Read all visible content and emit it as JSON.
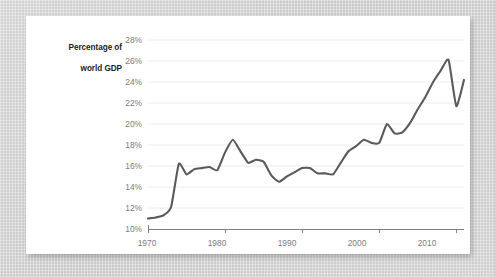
{
  "card": {
    "background_color": "#ffffff",
    "backdrop_color": "#d2d2d2"
  },
  "chart_data": {
    "type": "line",
    "title": "",
    "subtitle": "",
    "xlabel": "",
    "ylabel": "Percentage of\nworld GDP",
    "ylabel_line1": "Percentage of",
    "ylabel_line2": "world GDP",
    "xlim": [
      1970,
      2011
    ],
    "ylim": [
      10,
      28
    ],
    "ytick_step": 2,
    "grid": "horizontal",
    "legend": "none",
    "line_color": "#5a5a5a",
    "line_width": 2.1,
    "axis_color": "#808080",
    "gridline_color": "#ececec",
    "tick_label_color": "#7c7c7c",
    "ytick_labels": [
      "28%",
      "26%",
      "24%",
      "22%",
      "20%",
      "18%",
      "16%",
      "14%",
      "12%",
      "10%"
    ],
    "ytick_values": [
      28,
      26,
      24,
      22,
      20,
      18,
      16,
      14,
      12,
      10
    ],
    "xtick_labels": [
      "1970",
      "1980",
      "1990",
      "2000",
      "2010"
    ],
    "xtick_values": [
      1970,
      1980,
      1990,
      2000,
      2010
    ],
    "x": [
      1970,
      1971,
      1972,
      1973,
      1974,
      1975,
      1976,
      1977,
      1978,
      1979,
      1980,
      1981,
      1982,
      1983,
      1984,
      1985,
      1986,
      1987,
      1988,
      1989,
      1990,
      1991,
      1992,
      1993,
      1994,
      1995,
      1996,
      1997,
      1998,
      1999,
      2000,
      2001,
      2002,
      2003,
      2004,
      2005,
      2006,
      2007,
      2008,
      2009,
      2010,
      2011
    ],
    "values": [
      11.0,
      11.1,
      11.3,
      12.1,
      16.2,
      15.2,
      15.7,
      15.8,
      15.9,
      15.6,
      17.3,
      18.5,
      17.4,
      16.3,
      16.6,
      16.4,
      15.1,
      14.5,
      15.0,
      15.4,
      15.8,
      15.8,
      15.3,
      15.3,
      15.2,
      16.3,
      17.4,
      17.9,
      18.5,
      18.2,
      18.2,
      20.0,
      19.1,
      19.2,
      20.1,
      21.4,
      22.6,
      24.0,
      25.1,
      26.1,
      21.7,
      24.2
    ],
    "series": [
      {
        "name": "Percentage of world GDP",
        "values": [
          11.0,
          11.1,
          11.3,
          12.1,
          16.2,
          15.2,
          15.7,
          15.8,
          15.9,
          15.6,
          17.3,
          18.5,
          17.4,
          16.3,
          16.6,
          16.4,
          15.1,
          14.5,
          15.0,
          15.4,
          15.8,
          15.8,
          15.3,
          15.3,
          15.2,
          16.3,
          17.4,
          17.9,
          18.5,
          18.2,
          18.2,
          20.0,
          19.1,
          19.2,
          20.1,
          21.4,
          22.6,
          24.0,
          25.1,
          26.1,
          21.7,
          24.2
        ]
      }
    ]
  }
}
